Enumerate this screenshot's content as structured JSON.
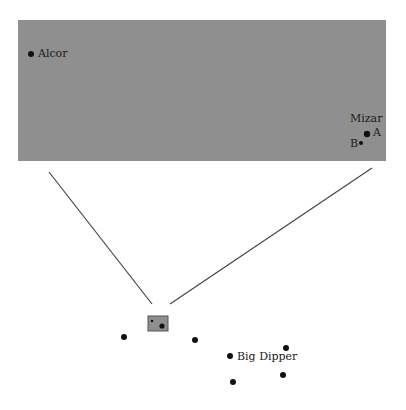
{
  "zoom_panel": {
    "background": "#8f8f8f",
    "stars": [
      {
        "name": "Alcor",
        "label": "Alcor"
      },
      {
        "name": "Mizar",
        "label": "Mizar"
      },
      {
        "name": "Mizar A",
        "label": "A"
      },
      {
        "name": "Mizar B",
        "label": "B"
      }
    ]
  },
  "sky": {
    "constellation_label": "Big Dipper"
  }
}
